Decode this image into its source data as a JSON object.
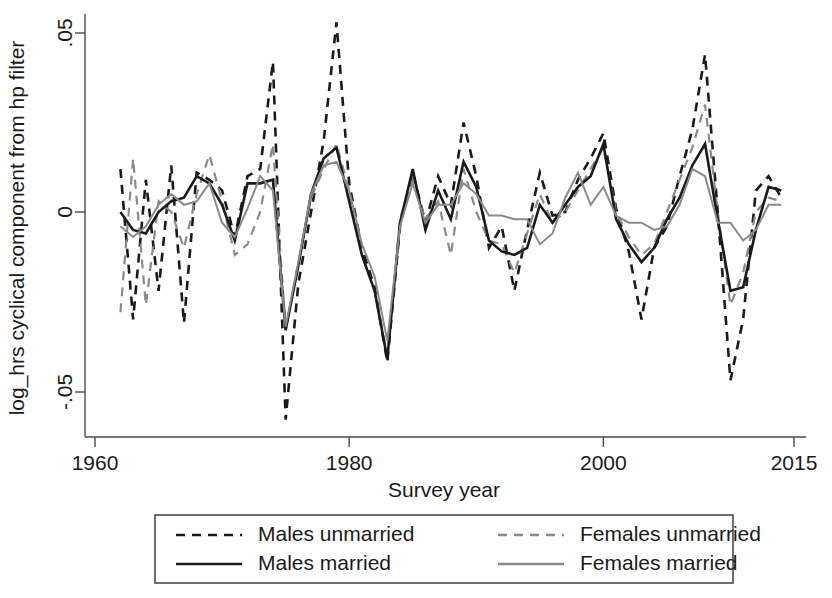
{
  "figure": {
    "background": "#ffffff",
    "axis_color": "#4a4a4a"
  },
  "chart_data": {
    "type": "line",
    "title": "",
    "xlabel": "Survey year",
    "ylabel": "log_hrs cyclical component from hp filter",
    "xlim": [
      1960,
      2015
    ],
    "ylim": [
      -0.062,
      0.057
    ],
    "xticks": [
      1960,
      1980,
      2000,
      2015
    ],
    "xticklabels": [
      "1960",
      "1980",
      "2000",
      "2015"
    ],
    "yticks": [
      0.05,
      0,
      -0.05
    ],
    "yticklabels": [
      ".05",
      "0",
      "-.05"
    ],
    "grid": false,
    "legend_position": "below-outside",
    "x": [
      1962,
      1963,
      1964,
      1965,
      1966,
      1967,
      1968,
      1969,
      1970,
      1971,
      1972,
      1973,
      1974,
      1975,
      1976,
      1977,
      1978,
      1979,
      1980,
      1981,
      1982,
      1983,
      1984,
      1985,
      1986,
      1987,
      1988,
      1989,
      1990,
      1991,
      1992,
      1993,
      1994,
      1995,
      1996,
      1997,
      1998,
      1999,
      2000,
      2001,
      2002,
      2003,
      2004,
      2005,
      2006,
      2007,
      2008,
      2009,
      2010,
      2011,
      2012,
      2013,
      2014
    ],
    "series": [
      {
        "name": "Males unmarried",
        "color": "#1a1a1a",
        "style": "dashed",
        "width": 2.6,
        "values": [
          0.012,
          -0.03,
          0.009,
          -0.022,
          0.013,
          -0.031,
          0.011,
          0.009,
          0.006,
          -0.007,
          0.01,
          0.012,
          0.042,
          -0.058,
          -0.02,
          0.0,
          0.02,
          0.053,
          0.008,
          -0.01,
          -0.021,
          -0.042,
          -0.004,
          0.011,
          -0.003,
          0.01,
          0.002,
          0.025,
          0.01,
          -0.01,
          -0.004,
          -0.022,
          -0.005,
          0.011,
          -0.001,
          0.0,
          0.009,
          0.015,
          0.022,
          0.001,
          -0.011,
          -0.03,
          -0.01,
          -0.004,
          0.01,
          0.023,
          0.044,
          0.0,
          -0.047,
          -0.03,
          0.006,
          0.01,
          0.004
        ]
      },
      {
        "name": "Females unmarried",
        "color": "#8a8a8a",
        "style": "dashed",
        "width": 2.2,
        "values": [
          -0.028,
          0.015,
          -0.026,
          0.003,
          0.0,
          -0.01,
          0.005,
          0.016,
          0.003,
          -0.012,
          -0.009,
          0.0,
          0.019,
          -0.033,
          -0.014,
          0.004,
          0.012,
          0.019,
          0.006,
          -0.012,
          -0.022,
          -0.04,
          -0.002,
          0.009,
          -0.002,
          0.003,
          -0.012,
          0.012,
          0.0,
          -0.008,
          -0.009,
          -0.017,
          -0.006,
          0.005,
          -0.003,
          0.0,
          0.006,
          0.012,
          0.018,
          0.0,
          -0.007,
          -0.012,
          -0.009,
          0.0,
          0.009,
          0.018,
          0.03,
          0.0,
          -0.026,
          -0.017,
          0.0,
          0.004,
          0.003
        ]
      },
      {
        "name": "Males married",
        "color": "#1a1a1a",
        "style": "solid",
        "width": 2.6,
        "values": [
          0.0,
          -0.005,
          -0.006,
          0.0,
          0.003,
          0.004,
          0.01,
          0.008,
          0.002,
          -0.008,
          0.008,
          0.008,
          0.009,
          -0.033,
          -0.015,
          0.005,
          0.015,
          0.018,
          0.003,
          -0.012,
          -0.022,
          -0.041,
          -0.003,
          0.012,
          -0.005,
          0.006,
          -0.002,
          0.014,
          0.007,
          -0.008,
          -0.011,
          -0.012,
          -0.01,
          0.002,
          -0.003,
          0.002,
          0.007,
          0.01,
          0.019,
          -0.002,
          -0.009,
          -0.014,
          -0.01,
          -0.002,
          0.004,
          0.013,
          0.019,
          -0.002,
          -0.022,
          -0.021,
          -0.005,
          0.007,
          0.006
        ]
      },
      {
        "name": "Females married",
        "color": "#8a8a8a",
        "style": "solid",
        "width": 2.0,
        "values": [
          -0.004,
          -0.007,
          -0.004,
          0.002,
          0.005,
          0.002,
          0.003,
          0.008,
          -0.003,
          -0.007,
          0.001,
          0.01,
          0.006,
          -0.032,
          -0.014,
          0.005,
          0.013,
          0.014,
          0.006,
          -0.009,
          -0.018,
          -0.036,
          -0.004,
          0.008,
          -0.003,
          0.002,
          0.002,
          0.008,
          0.005,
          -0.001,
          -0.001,
          -0.002,
          -0.002,
          -0.009,
          -0.006,
          0.004,
          0.011,
          0.002,
          0.007,
          -0.001,
          -0.003,
          -0.003,
          -0.005,
          -0.004,
          0.002,
          0.012,
          0.01,
          -0.003,
          -0.003,
          -0.008,
          -0.005,
          0.002,
          0.002
        ]
      }
    ]
  },
  "legend": {
    "entries": [
      {
        "label": "Males unmarried",
        "color": "#1a1a1a",
        "style": "dashed"
      },
      {
        "label": "Females unmarried",
        "color": "#8a8a8a",
        "style": "dashed"
      },
      {
        "label": "Males married",
        "color": "#1a1a1a",
        "style": "solid"
      },
      {
        "label": "Females married",
        "color": "#8a8a8a",
        "style": "solid"
      }
    ]
  }
}
